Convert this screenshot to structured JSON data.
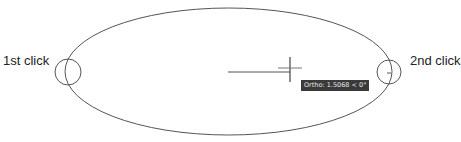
{
  "labels": {
    "first_click": "1st click",
    "second_click": "2nd click"
  },
  "tooltip": {
    "text": "Ortho: 1.5068 < 0°"
  },
  "colors": {
    "stroke": "#555555",
    "tooltip_bg": "#3a3a3a",
    "tooltip_text": "#e8e8e8",
    "background": "#ffffff"
  }
}
